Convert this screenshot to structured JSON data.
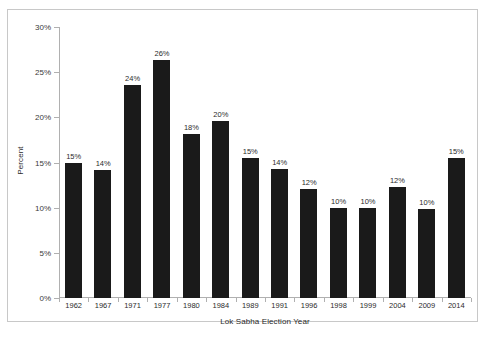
{
  "chart_data": {
    "type": "bar",
    "title": "",
    "xlabel": "Lok Sabha Election Year",
    "ylabel": "Percent",
    "categories": [
      "1962",
      "1967",
      "1971",
      "1977",
      "1980",
      "1984",
      "1989",
      "1991",
      "1996",
      "1998",
      "1999",
      "2004",
      "2009",
      "2014"
    ],
    "values": [
      15,
      14,
      24,
      26,
      18,
      20,
      15,
      14,
      12,
      10,
      10,
      12,
      10,
      15
    ],
    "bar_heights_pct": [
      15.0,
      14.2,
      23.6,
      26.3,
      18.2,
      19.6,
      15.5,
      14.3,
      12.1,
      10.0,
      10.0,
      12.3,
      9.8,
      15.5
    ],
    "data_labels": [
      "15%",
      "14%",
      "24%",
      "26%",
      "18%",
      "20%",
      "15%",
      "14%",
      "12%",
      "10%",
      "10%",
      "12%",
      "10%",
      "15%"
    ],
    "ylim": [
      0,
      30
    ],
    "ytick_values": [
      0,
      5,
      10,
      15,
      20,
      25,
      30
    ],
    "ytick_labels": [
      "0%",
      "5%",
      "10%",
      "15%",
      "20%",
      "25%",
      "30%"
    ],
    "grid": false,
    "legend": false,
    "bar_color": "#1a1a1a",
    "axis_color": "#b0b0b0",
    "frame_color": "#c8c8c8",
    "plot_background": "#ffffff"
  }
}
